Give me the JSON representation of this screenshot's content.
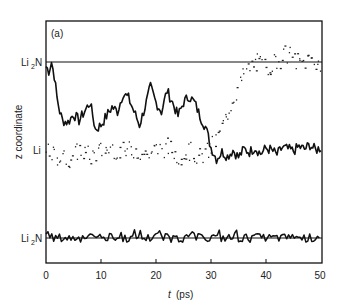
{
  "chart_data": {
    "type": "line",
    "panel_label": "(a)",
    "title": "",
    "xlabel": "t (ps)",
    "ylabel": "z coordinate",
    "xlim": [
      0,
      50
    ],
    "x_ticks": [
      0,
      10,
      20,
      30,
      40,
      50
    ],
    "y_levels": [
      {
        "label": "Li2N",
        "position": "upper",
        "description": "upper Li2N plane"
      },
      {
        "label": "Li",
        "position": "middle",
        "description": "Li plane"
      },
      {
        "label": "Li2N",
        "position": "lower",
        "description": "lower Li2N plane"
      }
    ],
    "grid": false,
    "legend": "none",
    "series": [
      {
        "name": "ion 1 (solid)",
        "style": "solid",
        "description": "Starts at upper Li2N plane, drops toward Li plane by ~2 ps, fluctuates between planes, settles at Li plane after ~30 ps",
        "x": [
          0,
          0.5,
          1,
          1.5,
          2,
          2.5,
          3,
          4,
          5,
          6,
          7,
          8,
          9,
          10,
          11,
          12,
          13,
          14,
          15,
          16,
          17,
          18,
          19,
          20,
          21,
          22,
          23,
          24,
          25,
          26,
          27,
          28,
          29,
          30,
          31,
          32,
          33,
          34,
          35,
          36,
          37,
          38,
          39,
          40,
          41,
          42,
          43,
          44,
          45,
          46,
          47,
          48,
          49,
          50
        ],
        "y_rel": [
          0.95,
          0.9,
          1.0,
          0.85,
          0.6,
          0.45,
          0.35,
          0.33,
          0.42,
          0.35,
          0.45,
          0.55,
          0.25,
          0.3,
          0.4,
          0.5,
          0.45,
          0.65,
          0.6,
          0.45,
          0.3,
          0.5,
          0.72,
          0.55,
          0.45,
          0.68,
          0.55,
          0.4,
          0.55,
          0.62,
          0.55,
          0.4,
          0.28,
          0.05,
          -0.08,
          0.0,
          -0.05,
          0.02,
          -0.06,
          0.03,
          0.0,
          0.05,
          -0.02,
          0.04,
          0.02,
          -0.03,
          0.05,
          0.03,
          0.01,
          0.06,
          0.03,
          0.08,
          0.02,
          0.05
        ]
      },
      {
        "name": "ion 2 (dotted)",
        "style": "dotted",
        "description": "Fluctuates around Li plane until ~30 ps, then migrates up to the upper Li2N plane by ~37 ps",
        "x": [
          0,
          2,
          4,
          6,
          8,
          10,
          12,
          14,
          16,
          18,
          20,
          22,
          24,
          26,
          28,
          30,
          31,
          32,
          33,
          34,
          35,
          36,
          37,
          38,
          40,
          42,
          44,
          46,
          48,
          50
        ],
        "y_rel": [
          0.0,
          -0.05,
          -0.08,
          0.03,
          -0.05,
          0.02,
          0.05,
          0.0,
          0.04,
          -0.02,
          0.03,
          0.06,
          -0.04,
          0.02,
          -0.06,
          0.05,
          0.15,
          0.3,
          0.45,
          0.6,
          0.75,
          0.88,
          0.95,
          1.0,
          0.95,
          1.02,
          1.1,
          0.98,
          1.05,
          0.97
        ]
      },
      {
        "name": "ion 3 (solid, lower)",
        "style": "solid",
        "description": "Vibrates about the lower Li2N plane throughout",
        "x": [
          0,
          50
        ],
        "y_rel_range": [
          -1.05,
          -0.95
        ]
      }
    ],
    "note": "y_rel: 1 = upper Li2N plane, 0 = Li plane, -1 = lower Li2N plane"
  },
  "labels": {
    "panel": "(a)",
    "ylabel": "z coordinate",
    "xlabel_t": "t",
    "xlabel_units": "(ps)",
    "level_upper_main": "Li",
    "level_upper_sub": "2",
    "level_upper_tail": "N",
    "level_mid": "Li",
    "level_lower_main": "Li",
    "level_lower_sub": "2",
    "level_lower_tail": "N",
    "ticks": [
      "0",
      "10",
      "20",
      "30",
      "40",
      "50"
    ]
  }
}
